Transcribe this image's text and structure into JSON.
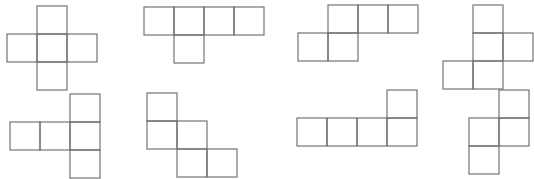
{
  "page": {
    "kind": "geometry-figure",
    "background_color": "#ffffff",
    "stroke_color": "#6e6e6e",
    "width": 526,
    "height": 173,
    "artifact_text_left": "",
    "artifact_text_right": ""
  },
  "grid": {
    "cell_width": 30,
    "cell_height": 28
  },
  "figures": [
    {
      "id": "figure-1",
      "name": "plus-cross-net",
      "label": "",
      "origin_x": 6,
      "origin_y": 5,
      "cell_width": 30,
      "cell_height": 28,
      "cells": [
        [
          1,
          0
        ],
        [
          0,
          1
        ],
        [
          1,
          1
        ],
        [
          2,
          1
        ],
        [
          1,
          2
        ]
      ]
    },
    {
      "id": "figure-2",
      "name": "row-of-four-with-cell-below-second",
      "label": "",
      "origin_x": 143,
      "origin_y": 6,
      "cell_width": 30,
      "cell_height": 28,
      "cells": [
        [
          0,
          0
        ],
        [
          1,
          0
        ],
        [
          2,
          0
        ],
        [
          3,
          0
        ],
        [
          1,
          1
        ]
      ]
    },
    {
      "id": "figure-3",
      "name": "offset-three-over-two-net",
      "label": "",
      "origin_x": 297,
      "origin_y": 4,
      "cell_width": 30,
      "cell_height": 28,
      "cells": [
        [
          1,
          0
        ],
        [
          2,
          0
        ],
        [
          3,
          0
        ],
        [
          0,
          1
        ],
        [
          1,
          1
        ]
      ]
    },
    {
      "id": "figure-4",
      "name": "vertical-three-with-side-cells-net",
      "label": "",
      "origin_x": 442,
      "origin_y": 4,
      "cell_width": 30,
      "cell_height": 28,
      "cells": [
        [
          1,
          0
        ],
        [
          1,
          1
        ],
        [
          2,
          1
        ],
        [
          0,
          2
        ],
        [
          1,
          2
        ]
      ]
    },
    {
      "id": "figure-5",
      "name": "two-plus-vertical-three-net",
      "label": "",
      "origin_x": 9,
      "origin_y": 93,
      "cell_width": 30,
      "cell_height": 28,
      "cells": [
        [
          2,
          0
        ],
        [
          0,
          1
        ],
        [
          1,
          1
        ],
        [
          2,
          1
        ],
        [
          2,
          2
        ]
      ]
    },
    {
      "id": "figure-6",
      "name": "staircase-net",
      "label": "",
      "origin_x": 146,
      "origin_y": 92,
      "cell_width": 30,
      "cell_height": 28,
      "cells": [
        [
          0,
          0
        ],
        [
          0,
          1
        ],
        [
          1,
          1
        ],
        [
          1,
          2
        ],
        [
          2,
          2
        ]
      ]
    },
    {
      "id": "figure-7",
      "name": "row-of-four-with-cell-above-fourth",
      "label": "",
      "origin_x": 296,
      "origin_y": 89,
      "cell_width": 30,
      "cell_height": 28,
      "cells": [
        [
          3,
          0
        ],
        [
          0,
          1
        ],
        [
          1,
          1
        ],
        [
          2,
          1
        ],
        [
          3,
          1
        ]
      ]
    },
    {
      "id": "figure-8",
      "name": "zigzag-s-net",
      "label": "",
      "origin_x": 438,
      "origin_y": 89,
      "cell_width": 30,
      "cell_height": 28,
      "cells": [
        [
          2,
          0
        ],
        [
          1,
          1
        ],
        [
          2,
          1
        ],
        [
          1,
          2
        ]
      ]
    }
  ]
}
